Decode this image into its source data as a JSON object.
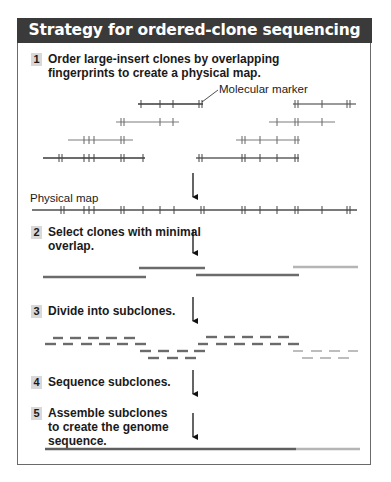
{
  "header": {
    "title": "Strategy for ordered-clone sequencing"
  },
  "steps": [
    {
      "number": "1",
      "lines": [
        "Order large-insert clones by overlapping",
        "fingerprints to create a physical map."
      ]
    },
    {
      "number": "2",
      "lines": [
        "Select clones with minimal",
        "overlap."
      ]
    },
    {
      "number": "3",
      "lines": [
        "Divide into subclones."
      ]
    },
    {
      "number": "4",
      "lines": [
        "Sequence subclones."
      ]
    },
    {
      "number": "5",
      "lines": [
        "Assemble subclones",
        "to create the genome",
        "sequence."
      ]
    }
  ],
  "labels": {
    "molecular_marker": "Molecular marker",
    "physical_map": "Physical map"
  },
  "colors": {
    "header_bg": "#3a3a3a",
    "dark_line": "#6b6b6b",
    "light_line": "#b5b5b5",
    "badge_bg": "#d8d8d8",
    "tick": "#444444"
  }
}
